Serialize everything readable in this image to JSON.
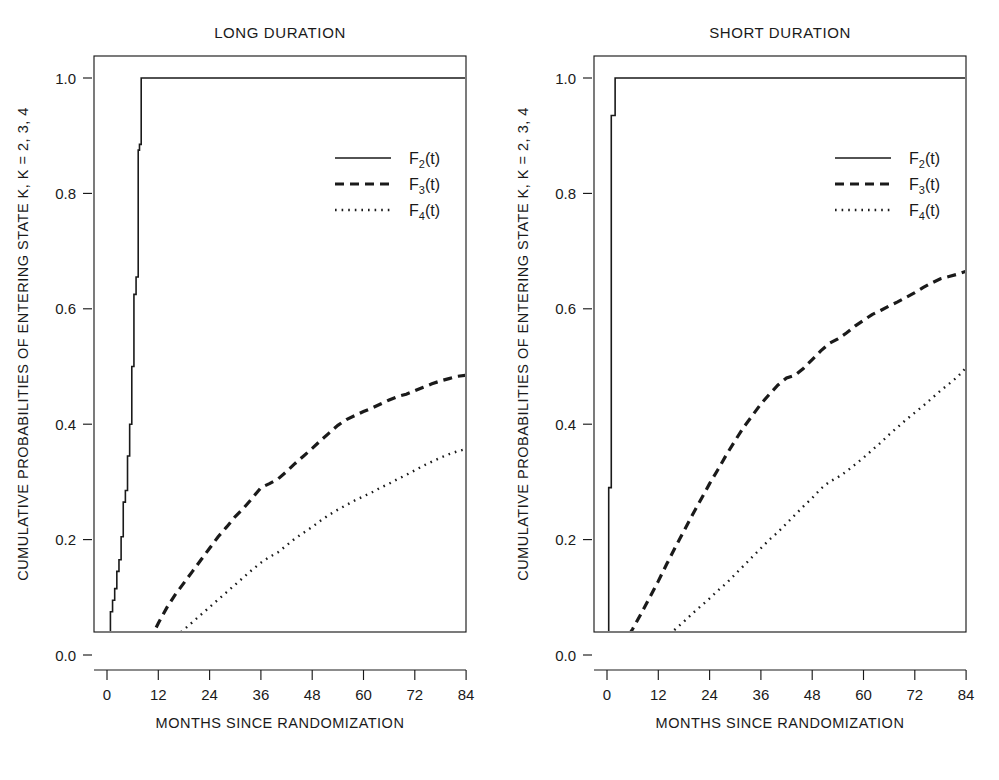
{
  "figure": {
    "background": "#ffffff",
    "ink": "#1a1a1a",
    "width": 999,
    "height": 780
  },
  "chart_data": [
    {
      "type": "line",
      "title": "LONG  DURATION",
      "xlabel": "MONTHS  SINCE  RANDOMIZATION",
      "ylabel": "CUMULATIVE  PROBABILITIES  OF  ENTERING  STATE  K, K = 2, 3, 4",
      "xlim": [
        -3,
        88
      ],
      "ylim": [
        -0.035,
        1.06
      ],
      "xticks": [
        0,
        12,
        24,
        36,
        48,
        60,
        72,
        84
      ],
      "xtick_labels": [
        "0",
        "12",
        "24",
        "36",
        "48",
        "60",
        "72",
        "84"
      ],
      "yticks": [
        0.0,
        0.2,
        0.4,
        0.6,
        0.8,
        1.0
      ],
      "ytick_labels": [
        "0.0",
        "0.2",
        "0.4",
        "0.6",
        "0.8",
        "1.0"
      ],
      "grid": false,
      "legend_position": "upper-right",
      "series": [
        {
          "name": "F2(t)",
          "style": "solid",
          "shape": "step",
          "x": [
            0,
            0.3,
            0.3,
            0.8,
            0.8,
            1.3,
            1.3,
            1.8,
            1.8,
            2.3,
            2.3,
            2.8,
            2.8,
            3.3,
            3.3,
            3.8,
            3.8,
            4.3,
            4.3,
            4.8,
            4.8,
            5.3,
            5.3,
            5.8,
            5.8,
            6.3,
            6.3,
            6.8,
            6.8,
            7.3,
            7.3,
            7.6,
            7.6,
            8.0,
            8.0,
            84
          ],
          "y": [
            0.0,
            0.0,
            0.025,
            0.025,
            0.075,
            0.075,
            0.095,
            0.095,
            0.115,
            0.115,
            0.145,
            0.145,
            0.165,
            0.165,
            0.205,
            0.205,
            0.265,
            0.265,
            0.285,
            0.285,
            0.345,
            0.345,
            0.4,
            0.4,
            0.5,
            0.5,
            0.625,
            0.625,
            0.655,
            0.655,
            0.875,
            0.875,
            0.885,
            0.885,
            1.0,
            1.0
          ]
        },
        {
          "name": "F3(t)",
          "style": "dashed",
          "shape": "linear",
          "x": [
            0,
            2,
            4,
            6,
            7,
            8,
            9,
            10,
            11,
            12,
            14,
            16,
            18,
            20,
            22,
            24,
            26,
            28,
            30,
            32,
            34,
            36,
            38,
            40,
            42,
            44,
            46,
            48,
            50,
            52,
            54,
            56,
            58,
            60,
            62,
            64,
            66,
            68,
            70,
            72,
            74,
            76,
            78,
            80,
            82,
            84
          ],
          "y": [
            0.0,
            0.005,
            0.01,
            0.012,
            0.015,
            0.015,
            0.02,
            0.028,
            0.04,
            0.055,
            0.082,
            0.105,
            0.125,
            0.145,
            0.165,
            0.185,
            0.205,
            0.222,
            0.24,
            0.255,
            0.272,
            0.29,
            0.297,
            0.305,
            0.318,
            0.332,
            0.345,
            0.358,
            0.372,
            0.385,
            0.398,
            0.408,
            0.415,
            0.422,
            0.428,
            0.435,
            0.442,
            0.448,
            0.452,
            0.458,
            0.464,
            0.47,
            0.475,
            0.479,
            0.483,
            0.485
          ]
        },
        {
          "name": "F4(t)",
          "style": "dotted",
          "shape": "linear",
          "x": [
            0,
            2,
            4,
            6,
            8,
            10,
            12,
            14,
            16,
            18,
            20,
            22,
            24,
            26,
            28,
            30,
            32,
            34,
            36,
            38,
            40,
            42,
            44,
            46,
            48,
            50,
            52,
            54,
            56,
            58,
            60,
            62,
            64,
            66,
            68,
            70,
            72,
            74,
            76,
            78,
            80,
            82,
            84
          ],
          "y": [
            0.0,
            0.002,
            0.004,
            0.006,
            0.008,
            0.01,
            0.013,
            0.022,
            0.032,
            0.044,
            0.057,
            0.07,
            0.083,
            0.096,
            0.109,
            0.122,
            0.135,
            0.148,
            0.16,
            0.17,
            0.178,
            0.19,
            0.202,
            0.212,
            0.222,
            0.233,
            0.243,
            0.252,
            0.26,
            0.268,
            0.275,
            0.282,
            0.29,
            0.297,
            0.305,
            0.312,
            0.32,
            0.328,
            0.335,
            0.342,
            0.348,
            0.353,
            0.357
          ]
        }
      ],
      "legend": [
        {
          "label": "F",
          "sub": "2",
          "suffix": "(t)",
          "style": "solid"
        },
        {
          "label": "F",
          "sub": "3",
          "suffix": "(t)",
          "style": "dashed"
        },
        {
          "label": "F",
          "sub": "4",
          "suffix": "(t)",
          "style": "dotted"
        }
      ]
    },
    {
      "type": "line",
      "title": "SHORT  DURATION",
      "xlabel": "MONTHS  SINCE  RANDOMIZATION",
      "ylabel": "CUMULATIVE  PROBABILITIES  OF  ENTERING  STATE  K, K = 2, 3, 4",
      "xlim": [
        -3,
        88
      ],
      "ylim": [
        -0.035,
        1.06
      ],
      "xticks": [
        0,
        12,
        24,
        36,
        48,
        60,
        72,
        84
      ],
      "xtick_labels": [
        "0",
        "12",
        "24",
        "36",
        "48",
        "60",
        "72",
        "84"
      ],
      "yticks": [
        0.0,
        0.2,
        0.4,
        0.6,
        0.8,
        1.0
      ],
      "ytick_labels": [
        "0.0",
        "0.2",
        "0.4",
        "0.6",
        "0.8",
        "1.0"
      ],
      "grid": false,
      "legend_position": "upper-right",
      "series": [
        {
          "name": "F2(t)",
          "style": "solid",
          "shape": "step",
          "x": [
            0,
            0.4,
            0.4,
            1.0,
            1.0,
            1.9,
            1.9,
            84
          ],
          "y": [
            0.0,
            0.0,
            0.29,
            0.29,
            0.935,
            0.935,
            1.0,
            1.0
          ]
        },
        {
          "name": "F3(t)",
          "style": "dashed",
          "shape": "linear",
          "x": [
            0,
            1,
            2,
            3,
            4,
            6,
            8,
            10,
            12,
            14,
            16,
            18,
            20,
            22,
            24,
            26,
            28,
            30,
            32,
            34,
            36,
            38,
            40,
            42,
            44,
            46,
            48,
            50,
            52,
            54,
            56,
            58,
            60,
            62,
            64,
            66,
            68,
            70,
            72,
            74,
            76,
            78,
            80,
            82,
            84
          ],
          "y": [
            0.0,
            0.003,
            0.008,
            0.014,
            0.022,
            0.045,
            0.072,
            0.1,
            0.128,
            0.158,
            0.187,
            0.215,
            0.243,
            0.27,
            0.297,
            0.322,
            0.348,
            0.372,
            0.395,
            0.415,
            0.435,
            0.452,
            0.468,
            0.48,
            0.485,
            0.497,
            0.512,
            0.527,
            0.54,
            0.548,
            0.558,
            0.57,
            0.58,
            0.59,
            0.597,
            0.605,
            0.612,
            0.62,
            0.628,
            0.637,
            0.645,
            0.652,
            0.656,
            0.66,
            0.665
          ]
        },
        {
          "name": "F4(t)",
          "style": "dotted",
          "shape": "linear",
          "x": [
            0,
            2,
            4,
            6,
            8,
            10,
            12,
            14,
            16,
            18,
            20,
            22,
            24,
            26,
            28,
            30,
            32,
            34,
            36,
            38,
            40,
            42,
            44,
            46,
            48,
            50,
            52,
            54,
            56,
            58,
            60,
            62,
            64,
            66,
            68,
            70,
            72,
            74,
            76,
            78,
            80,
            82,
            84
          ],
          "y": [
            0.0,
            0.004,
            0.008,
            0.012,
            0.018,
            0.024,
            0.028,
            0.032,
            0.045,
            0.058,
            0.072,
            0.085,
            0.098,
            0.112,
            0.125,
            0.14,
            0.155,
            0.17,
            0.185,
            0.2,
            0.213,
            0.228,
            0.243,
            0.258,
            0.272,
            0.288,
            0.3,
            0.308,
            0.318,
            0.33,
            0.342,
            0.355,
            0.368,
            0.382,
            0.395,
            0.408,
            0.42,
            0.432,
            0.445,
            0.458,
            0.47,
            0.482,
            0.498
          ]
        }
      ],
      "legend": [
        {
          "label": "F",
          "sub": "2",
          "suffix": "(t)",
          "style": "solid"
        },
        {
          "label": "F",
          "sub": "3",
          "suffix": "(t)",
          "style": "dashed"
        },
        {
          "label": "F",
          "sub": "4",
          "suffix": "(t)",
          "style": "dotted"
        }
      ]
    }
  ]
}
